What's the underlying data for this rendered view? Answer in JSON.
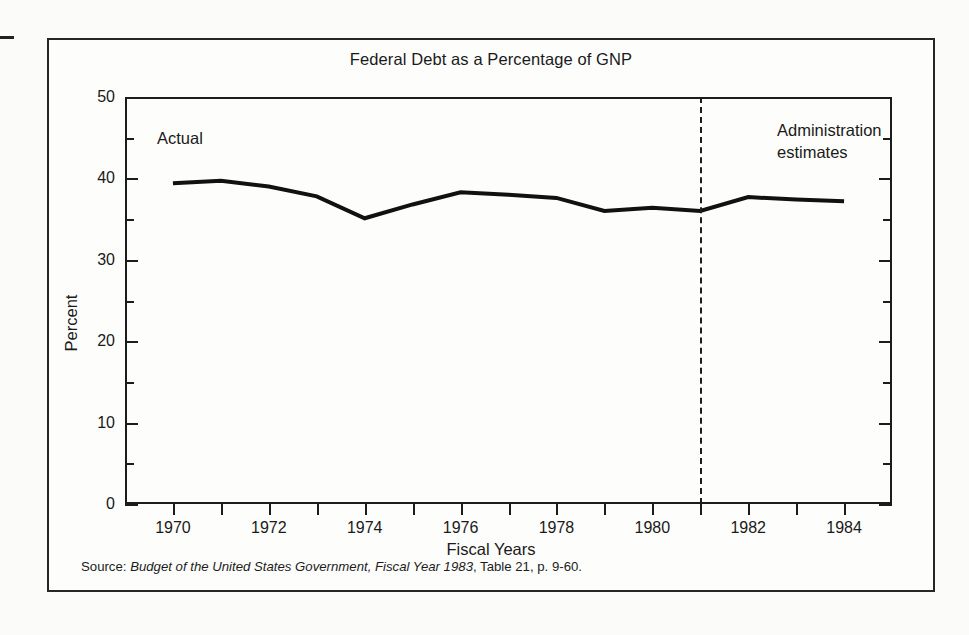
{
  "figure": {
    "title": "Federal Debt as a Percentage of GNP",
    "source_prefix": "Source: ",
    "source_italic": "Budget of the United States Government, Fiscal Year 1983",
    "source_suffix": ", Table 21, p. 9-60."
  },
  "annotations": {
    "actual": "Actual",
    "estimates": "Administration\nestimates"
  },
  "chart_data": {
    "type": "line",
    "title": "Federal Debt as a Percentage of GNP",
    "xlabel": "Fiscal Years",
    "ylabel": "Percent",
    "xlim": [
      1969,
      1985
    ],
    "ylim": [
      0,
      50
    ],
    "grid": false,
    "legend": false,
    "line_color": "#111111",
    "line_width_px": 4,
    "y_ticks_major": [
      0,
      10,
      20,
      30,
      40,
      50
    ],
    "y_ticks_minor": [
      5,
      15,
      25,
      35,
      45
    ],
    "y_tick_labels": [
      "0",
      "10",
      "20",
      "30",
      "40",
      "50"
    ],
    "x_ticks": [
      1970,
      1971,
      1972,
      1973,
      1974,
      1975,
      1976,
      1977,
      1978,
      1979,
      1980,
      1981,
      1982,
      1983,
      1984
    ],
    "x_tick_labels_shown": [
      "1970",
      "1972",
      "1974",
      "1976",
      "1978",
      "1980",
      "1982",
      "1984"
    ],
    "x": [
      1970,
      1971,
      1972,
      1973,
      1974,
      1975,
      1976,
      1977,
      1978,
      1979,
      1980,
      1981,
      1982,
      1983,
      1984
    ],
    "values": [
      39.4,
      39.7,
      39.0,
      37.8,
      35.1,
      36.8,
      38.3,
      38.0,
      37.6,
      36.0,
      36.4,
      36.0,
      37.7,
      37.4,
      37.2
    ],
    "annotations": [
      {
        "text": "Actual",
        "x": 1971.3,
        "y": 45.5
      },
      {
        "text": "Administration estimates",
        "x": 1982.0,
        "y": 46.5
      }
    ],
    "divider": {
      "x": 1981,
      "style": "dashed",
      "label_left": "Actual",
      "label_right": "Administration estimates"
    },
    "source": "Source: Budget of the United States Government, Fiscal Year 1983, Table 21, p. 9-60."
  }
}
